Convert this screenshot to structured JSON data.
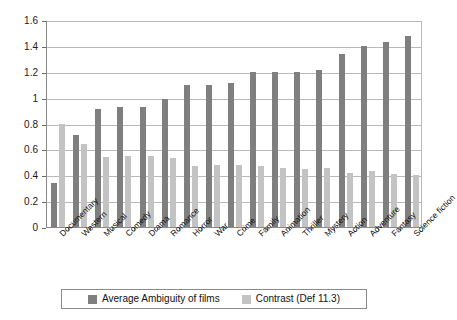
{
  "chart_data": {
    "type": "bar",
    "title": "",
    "subtitle": "",
    "xlabel": "",
    "ylabel": "",
    "ylim": [
      0,
      1.6
    ],
    "ytick_step": 0.2,
    "yticks": [
      "0",
      "0.2",
      "0.4",
      "0.6",
      "0.8",
      "1",
      "1.2",
      "1.4",
      "1.6"
    ],
    "grid": true,
    "legend_position": "bottom-center",
    "categories": [
      "Documentary",
      "Western",
      "Musical",
      "Comedy",
      "Drama",
      "Romance",
      "Horror",
      "War",
      "Crime",
      "Family",
      "Animation",
      "Thriller",
      "Mystery",
      "Action",
      "Adventure",
      "Fantasy",
      "Science fiction"
    ],
    "series": [
      {
        "name": "Average Ambiguity of films",
        "color": "#7f7f7f",
        "values": [
          0.34,
          0.71,
          0.91,
          0.93,
          0.93,
          0.99,
          1.1,
          1.1,
          1.11,
          1.2,
          1.2,
          1.2,
          1.21,
          1.34,
          1.4,
          1.43,
          1.48
        ]
      },
      {
        "name": "Contrast (Def 11.3)",
        "color": "#c3c3c3",
        "values": [
          0.8,
          0.64,
          0.54,
          0.55,
          0.55,
          0.53,
          0.47,
          0.48,
          0.48,
          0.47,
          0.46,
          0.45,
          0.46,
          0.42,
          0.43,
          0.41,
          0.4
        ]
      }
    ]
  },
  "legend": {
    "items": [
      {
        "label": "Average Ambiguity of films",
        "swatch": "dark"
      },
      {
        "label": "Contrast (Def 11.3)",
        "swatch": "light"
      }
    ]
  },
  "colors": {
    "series_dark": "#7f7f7f",
    "series_light": "#c3c3c3",
    "gridline": "#b9b9b9",
    "axis": "#8a8a8a",
    "text": "#111111",
    "background": "#ffffff"
  }
}
